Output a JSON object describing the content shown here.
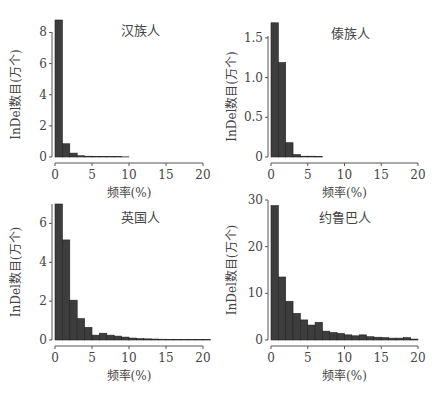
{
  "chart_data": [
    {
      "type": "bar",
      "title": "汉族人",
      "xlabel": "频率(%)",
      "ylabel": "InDel数目(万个)",
      "xlim": [
        0,
        20
      ],
      "ylim": [
        0,
        8.8
      ],
      "xticks": [
        0,
        5,
        10,
        15,
        20
      ],
      "yticks": [
        0,
        2,
        4,
        6,
        8
      ],
      "bin_width": 1,
      "x": [
        0,
        1,
        2,
        3,
        4,
        5,
        6,
        7,
        8,
        9
      ],
      "values": [
        8.8,
        0.85,
        0.25,
        0.08,
        0.05,
        0.04,
        0.03,
        0.02,
        0.02,
        0.01
      ],
      "grid": false
    },
    {
      "type": "bar",
      "title": "傣族人",
      "xlabel": "频率(%)",
      "ylabel": "InDel数目(万个)",
      "xlim": [
        0,
        20
      ],
      "ylim": [
        0,
        1.7
      ],
      "xticks": [
        0,
        5,
        10,
        15,
        20
      ],
      "yticks": [
        0,
        0.5,
        1.0,
        1.5
      ],
      "ytick_labels": [
        "0",
        "0.5",
        "1.0",
        "1.5"
      ],
      "bin_width": 1,
      "x": [
        0,
        1,
        2,
        3,
        4,
        5,
        6
      ],
      "values": [
        1.69,
        1.19,
        0.18,
        0.03,
        0.01,
        0.01,
        0.005
      ],
      "grid": false
    },
    {
      "type": "bar",
      "title": "英国人",
      "xlabel": "频率(%)",
      "ylabel": "InDel数目(万个)",
      "xlim": [
        0,
        20
      ],
      "ylim": [
        0,
        7
      ],
      "xticks": [
        0,
        5,
        10,
        15,
        20
      ],
      "yticks": [
        0,
        2,
        4,
        6
      ],
      "bin_width": 1,
      "x": [
        0,
        1,
        2,
        3,
        4,
        5,
        6,
        7,
        8,
        9,
        10,
        11,
        12,
        13,
        14,
        15,
        16,
        17,
        18,
        19,
        20
      ],
      "values": [
        7.0,
        5.15,
        2.05,
        1.1,
        0.65,
        0.25,
        0.35,
        0.25,
        0.2,
        0.15,
        0.1,
        0.07,
        0.06,
        0.05,
        0.04,
        0.03,
        0.03,
        0.02,
        0.02,
        0.02,
        0.02
      ],
      "grid": false
    },
    {
      "type": "bar",
      "title": "约鲁巴人",
      "xlabel": "频率(%)",
      "ylabel": "InDel数目(万个)",
      "xlim": [
        0,
        20
      ],
      "ylim": [
        0,
        30
      ],
      "xticks": [
        0,
        5,
        10,
        15,
        20
      ],
      "yticks": [
        0,
        10,
        20,
        30
      ],
      "bin_width": 1,
      "x": [
        0,
        1,
        2,
        3,
        4,
        5,
        6,
        7,
        8,
        9,
        10,
        11,
        12,
        13,
        14,
        15,
        16,
        17,
        18,
        19
      ],
      "values": [
        28.8,
        13.5,
        8.3,
        5.7,
        4.3,
        3.2,
        3.8,
        1.9,
        1.6,
        1.4,
        1.1,
        0.9,
        1.1,
        0.7,
        0.6,
        0.5,
        0.4,
        0.4,
        0.5,
        0.2
      ],
      "grid": false
    }
  ]
}
